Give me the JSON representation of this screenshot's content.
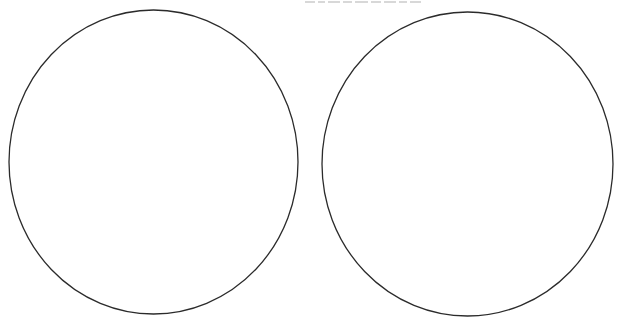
{
  "canvas": {
    "width": 627,
    "height": 325,
    "background": "#ffffff"
  },
  "caption": {
    "visible": "clipped-illegible",
    "color": "#d8d8d8"
  },
  "shapes": [
    {
      "type": "circle-outline",
      "label": "left-circle",
      "cx": 153.5,
      "cy": 162,
      "rx": 144.5,
      "ry": 152,
      "stroke": "#2b2b2b",
      "stroke_width": 1.3,
      "fill": "#ffffff"
    },
    {
      "type": "circle-outline",
      "label": "right-circle",
      "cx": 467.5,
      "cy": 164,
      "rx": 145.5,
      "ry": 152,
      "stroke": "#2b2b2b",
      "stroke_width": 1.3,
      "fill": "#ffffff"
    }
  ]
}
